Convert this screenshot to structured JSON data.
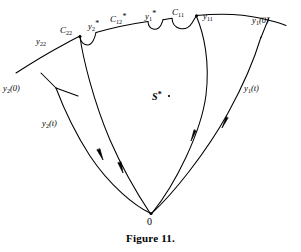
{
  "figure": {
    "caption": "Figure 11.",
    "region_label": "S",
    "region_star": "*",
    "origin_label": "0",
    "labels": [
      {
        "id": "y1-0",
        "base": "y",
        "sub": "1",
        "suffix": "(0)",
        "star": "",
        "x": 252,
        "y": 20
      },
      {
        "id": "y11",
        "base": "y",
        "sub": "11",
        "suffix": "",
        "star": "",
        "x": 207,
        "y": 16
      },
      {
        "id": "C11",
        "base": "C",
        "sub": "11",
        "suffix": "",
        "star": "",
        "x": 176,
        "y": 14
      },
      {
        "id": "y1s",
        "base": "y",
        "sub": "1",
        "suffix": "",
        "star": "*",
        "x": 148,
        "y": 15
      },
      {
        "id": "C12s",
        "base": "C",
        "sub": "12",
        "suffix": "",
        "star": "*",
        "x": 113,
        "y": 20
      },
      {
        "id": "y2s",
        "base": "y",
        "sub": "2",
        "suffix": "",
        "star": "*",
        "x": 90,
        "y": 25
      },
      {
        "id": "C22",
        "base": "C",
        "sub": "22",
        "suffix": "",
        "star": "",
        "x": 63,
        "y": 31
      },
      {
        "id": "y22",
        "base": "y",
        "sub": "22",
        "suffix": "",
        "star": "",
        "x": 38,
        "y": 41
      },
      {
        "id": "y2-0",
        "base": "y",
        "sub": "2",
        "suffix": "(0)",
        "star": "",
        "x": 4,
        "y": 88
      },
      {
        "id": "y2-t",
        "base": "y",
        "sub": "2",
        "suffix": "(t)",
        "star": "",
        "x": 42,
        "y": 124
      },
      {
        "id": "y1-t",
        "base": "y",
        "sub": "1",
        "suffix": "(t)",
        "star": "",
        "x": 245,
        "y": 88
      }
    ],
    "colors": {
      "ink": "#000000",
      "background": "#ffffff"
    }
  }
}
